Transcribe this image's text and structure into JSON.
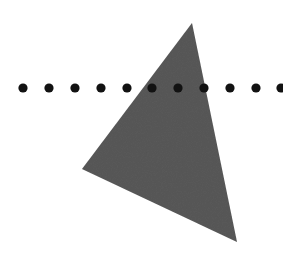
{
  "diagram": {
    "background": "#ffffff",
    "triangle": {
      "points": [
        [
          192,
          23
        ],
        [
          82,
          169
        ],
        [
          237,
          242
        ]
      ],
      "fill": "#5b5b5b"
    },
    "dot_row": {
      "y": 88,
      "x_positions": [
        23,
        49,
        75,
        101,
        127,
        152,
        178,
        204,
        230,
        256,
        281
      ],
      "radius": 4.6,
      "fill": "#121212"
    }
  }
}
